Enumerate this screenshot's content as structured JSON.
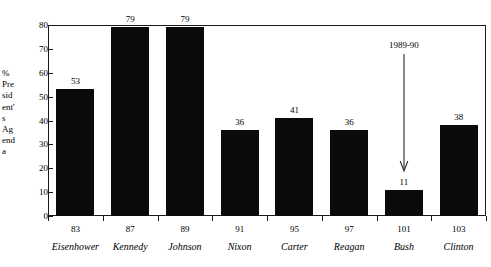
{
  "chart_data": {
    "type": "bar",
    "title": "",
    "subtitle": "",
    "xlabel": "",
    "ylabel": "% President's Agenda",
    "ylabel_lines": [
      "%",
      "Pre",
      "sid",
      "ent'",
      "s",
      "Ag",
      "end",
      "a"
    ],
    "ylim": [
      0,
      80
    ],
    "ytick_values": [
      0,
      10,
      20,
      30,
      40,
      50,
      60,
      70,
      80
    ],
    "ytick_labels": [
      "0",
      "10",
      "20",
      "30",
      "40",
      "50",
      "60",
      "70",
      "80"
    ],
    "grid": false,
    "legend": null,
    "legend_position": "none",
    "categories": [
      "83",
      "87",
      "89",
      "91",
      "95",
      "97",
      "101",
      "103"
    ],
    "category_sublabels": [
      "Eisenhower",
      "Kennedy",
      "Johnson",
      "Nixon",
      "Carter",
      "Reagan",
      "Bush",
      "Clinton"
    ],
    "values": [
      53,
      79,
      79,
      36,
      41,
      36,
      11,
      38
    ],
    "value_labels": [
      "53",
      "79",
      "79",
      "36",
      "41",
      "36",
      "11",
      "38"
    ],
    "bar_color": "#0a0a0a",
    "annotations": [
      {
        "text": "1989-90",
        "target_category": "101",
        "target_sublabel": "Bush",
        "style": "arrow-down"
      }
    ]
  },
  "colors": {
    "axis": "#1a1a1a",
    "bar": "#0a0a0a",
    "background": "#ffffff",
    "text": "#000000"
  }
}
